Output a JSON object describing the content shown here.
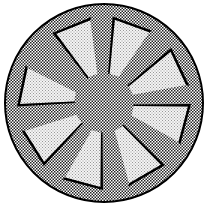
{
  "image": {
    "subject": "wheel-hubcap-illustration",
    "style": "halftone dithered clipart",
    "spoke_count": 8,
    "colors": {
      "background": "#ffffff",
      "outline": "#000000",
      "dither_dark": "#1a1a1a",
      "dither_light": "#ffffff",
      "window_fill": "#e6e6e6",
      "shadow": "#000000"
    },
    "geometry": {
      "center": [
        104,
        103
      ],
      "outer_radius": 99,
      "hub_radius": 24,
      "window_inner_radius": 30,
      "window_outer_radius": 84,
      "spoke_angles_deg": [
        -112,
        -70,
        -25,
        15,
        60,
        105,
        148,
        192
      ]
    }
  }
}
